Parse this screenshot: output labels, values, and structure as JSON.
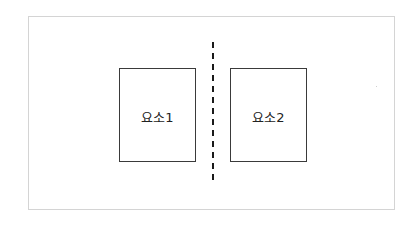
{
  "diagram": {
    "elements": [
      {
        "label": "요소1"
      },
      {
        "label": "요소2"
      }
    ],
    "divider": {
      "style": "dashed",
      "orientation": "vertical",
      "color": "#1a1a1a"
    },
    "colors": {
      "frame_border": "#d4d4d4",
      "box_border": "#3a3a3a",
      "text": "#222222",
      "background": "#ffffff"
    }
  }
}
